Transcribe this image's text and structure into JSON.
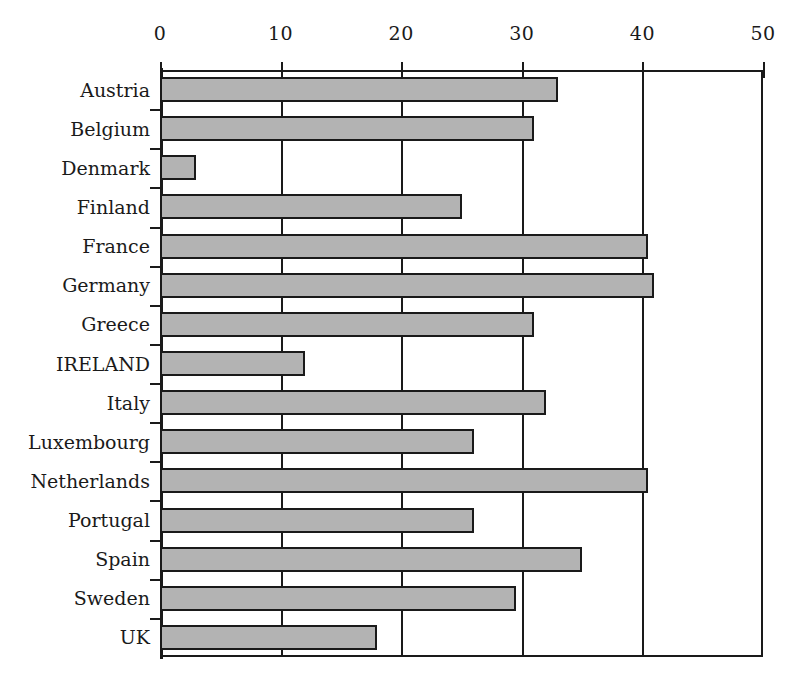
{
  "chart_data": {
    "type": "bar",
    "orientation": "horizontal",
    "title": "",
    "subtitle": "",
    "xlabel": "",
    "ylabel": "",
    "categories": [
      "Austria",
      "Belgium",
      "Denmark",
      "Finland",
      "France",
      "Germany",
      "Greece",
      "IRELAND",
      "Italy",
      "Luxembourg",
      "Netherlands",
      "Portugal",
      "Spain",
      "Sweden",
      "UK"
    ],
    "values": [
      33,
      31,
      3,
      25,
      40.5,
      41,
      31,
      12,
      32,
      26,
      40.5,
      26,
      35,
      29.5,
      18
    ],
    "xlim": [
      0,
      50
    ],
    "xticks": [
      0,
      10,
      20,
      30,
      40,
      50
    ],
    "xtick_labels": [
      "0",
      "10",
      "20",
      "30",
      "40",
      "50"
    ],
    "gridlines": [
      10,
      20,
      30,
      40
    ],
    "grid": true,
    "legend": null,
    "bar_fill_color": "#b3b3b3",
    "bar_edge_color": "#1a1a1a",
    "axis_color": "#1a1a1a",
    "background_color": "#ffffff",
    "annotations": []
  }
}
